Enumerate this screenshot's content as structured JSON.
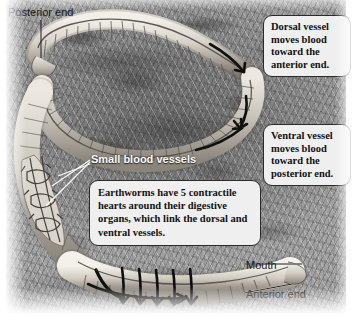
{
  "figure": {
    "background_label": "soil-burrow-texture"
  },
  "labels": {
    "posterior_end": "Posterior end",
    "anterior_end": "Anterior end",
    "mouth": "Mouth",
    "small_blood_vessels": "Small blood vessels"
  },
  "callouts": {
    "dorsal": "Dorsal vessel moves blood toward the anterior end.",
    "ventral": "Ventral vessel moves blood toward the posterior end.",
    "hearts": "Earthworms have 5 contractile hearts around their digestive organs, which link the dorsal and ventral vessels."
  },
  "colors": {
    "callout_fill": "#efefef",
    "callout_border": "#2a2a2a",
    "label_dark": "#1a1a1a",
    "label_white": "#ffffff",
    "worm_body_light": "#e8e4dc",
    "worm_body_mid": "#b4aea4",
    "worm_outline": "#3a3a38",
    "arrow_black": "#101010",
    "soil_mid": "#8e8e8e"
  },
  "annotations": {
    "flow_arrow_count_body": 4,
    "heart_arrow_count": 5,
    "heart_count_text": "5"
  }
}
